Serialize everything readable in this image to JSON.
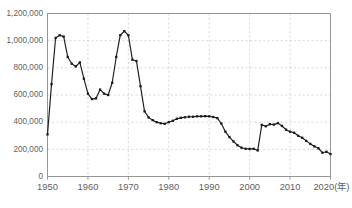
{
  "chart_data": {
    "type": "line",
    "title": "",
    "subtitle": "",
    "xlabel": "(年)",
    "ylabel": "",
    "xlim": [
      1950,
      2020
    ],
    "ylim": [
      0,
      1200000
    ],
    "grid": true,
    "legend": "none",
    "markers": "square",
    "line_color": "#1b1b1b",
    "grid_color": "#c9c9c9",
    "axis_color": "#8a8a8a",
    "x_ticks": [
      1950,
      1960,
      1970,
      1980,
      1990,
      2000,
      2010,
      2020
    ],
    "x_tick_labels": [
      "1950",
      "1960",
      "1970",
      "1980",
      "1990",
      "2000",
      "2010",
      "2020(年)"
    ],
    "y_ticks": [
      0,
      200000,
      400000,
      600000,
      800000,
      1000000,
      1200000
    ],
    "y_tick_labels": [
      "0",
      "200,000",
      "400,000",
      "600,000",
      "800,000",
      "1,000,000",
      "1,200,000"
    ],
    "x": [
      1950,
      1951,
      1952,
      1953,
      1954,
      1955,
      1956,
      1957,
      1958,
      1959,
      1960,
      1961,
      1962,
      1963,
      1964,
      1965,
      1966,
      1967,
      1968,
      1969,
      1970,
      1971,
      1972,
      1973,
      1974,
      1975,
      1976,
      1977,
      1978,
      1979,
      1980,
      1981,
      1982,
      1983,
      1984,
      1985,
      1986,
      1987,
      1988,
      1989,
      1990,
      1991,
      1992,
      1993,
      1994,
      1995,
      1996,
      1997,
      1998,
      1999,
      2000,
      2001,
      2002,
      2003,
      2004,
      2005,
      2006,
      2007,
      2008,
      2009,
      2010,
      2011,
      2012,
      2013,
      2014,
      2015,
      2016,
      2017,
      2018,
      2019,
      2020
    ],
    "series": [
      {
        "name": "件数",
        "values": [
          310000,
          680000,
          1020000,
          1040000,
          1030000,
          880000,
          830000,
          810000,
          840000,
          720000,
          610000,
          570000,
          575000,
          640000,
          610000,
          600000,
          690000,
          880000,
          1040000,
          1070000,
          1040000,
          860000,
          850000,
          665000,
          480000,
          435000,
          415000,
          400000,
          392000,
          388000,
          400000,
          410000,
          425000,
          432000,
          436000,
          440000,
          440000,
          443000,
          443000,
          444000,
          443000,
          438000,
          430000,
          390000,
          330000,
          290000,
          258000,
          230000,
          212000,
          204000,
          203000,
          204000,
          192000,
          380000,
          370000,
          385000,
          382000,
          393000,
          372000,
          345000,
          330000,
          322000,
          300000,
          285000,
          262000,
          240000,
          222000,
          208000,
          175000,
          182000,
          165000
        ]
      }
    ]
  }
}
